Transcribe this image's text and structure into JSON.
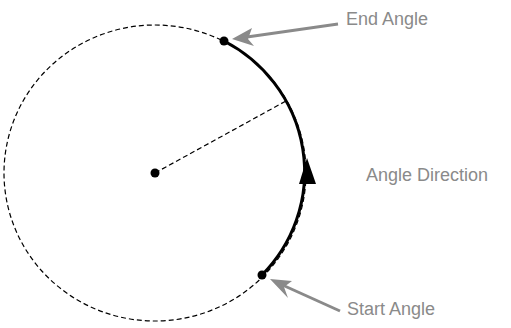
{
  "diagram": {
    "labels": {
      "end_angle": "End Angle",
      "start_angle": "Start Angle",
      "angle_direction": "Angle Direction"
    },
    "colors": {
      "stroke": "#000000",
      "label": "#8a8a8a",
      "pointer_arrow": "#8a8a8a",
      "background": "#ffffff"
    },
    "geometry": {
      "center": [
        155,
        173
      ],
      "radius": 150,
      "start_point": [
        262,
        275
      ],
      "end_point": [
        224,
        41
      ],
      "radius_line_end": [
        286,
        101
      ]
    }
  }
}
